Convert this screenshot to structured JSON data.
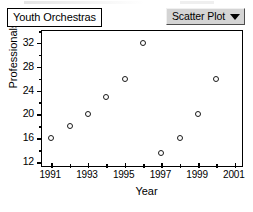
{
  "window": {
    "title_label": "Youth Orchestras",
    "plot_type_selector": {
      "value": "Scatter Plot",
      "icon": "chevron-down-icon"
    }
  },
  "colors": {
    "background": "#ffffff",
    "axis": "#000000",
    "marker_edge": "#1a1a1a",
    "marker_fill": "#ffffff",
    "dropdown_face": "#d4d4d4"
  },
  "chart_data": {
    "type": "scatter",
    "title": "Youth Orchestras",
    "xlabel": "Year",
    "ylabel": "Professionals",
    "xlim": [
      1990.5,
      2001.5
    ],
    "ylim": [
      11,
      34
    ],
    "grid": false,
    "legend": null,
    "x_tick_labels": [
      "1991",
      "1993",
      "1995",
      "1997",
      "1999",
      "2001"
    ],
    "x_tick_values": [
      1991,
      1993,
      1995,
      1997,
      1999,
      2001
    ],
    "x_minor_ticks": [
      1992,
      1994,
      1996,
      1998,
      2000
    ],
    "y_tick_labels": [
      "12",
      "16",
      "20",
      "24",
      "28",
      "32"
    ],
    "y_tick_values": [
      12,
      16,
      20,
      24,
      28,
      32
    ],
    "x": [
      1991,
      1992,
      1993,
      1994,
      1995,
      1996,
      1997,
      1998,
      1999,
      2000
    ],
    "values": [
      16,
      18,
      20,
      23,
      26,
      32,
      13.5,
      16,
      20,
      26
    ],
    "points": [
      {
        "x": 1991,
        "y": 16
      },
      {
        "x": 1992,
        "y": 18
      },
      {
        "x": 1993,
        "y": 20
      },
      {
        "x": 1994,
        "y": 23
      },
      {
        "x": 1995,
        "y": 26
      },
      {
        "x": 1996,
        "y": 32
      },
      {
        "x": 1997,
        "y": 13.5
      },
      {
        "x": 1998,
        "y": 16
      },
      {
        "x": 1999,
        "y": 20
      },
      {
        "x": 2000,
        "y": 26
      }
    ]
  }
}
